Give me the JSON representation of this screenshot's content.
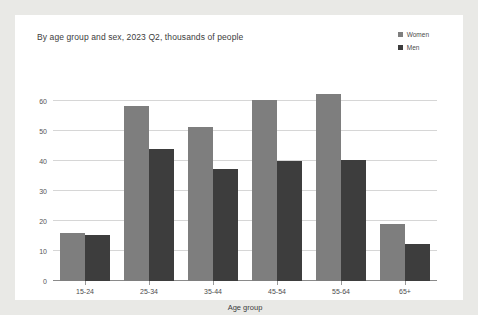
{
  "chart_data": {
    "type": "bar",
    "title": "By age group and sex, 2023 Q2, thousands of people",
    "xlabel": "Age group",
    "ylabel": "",
    "categories": [
      "15-24",
      "25-34",
      "35-44",
      "45-54",
      "55-64",
      "65+"
    ],
    "series": [
      {
        "name": "Women",
        "color": "#7e7e7e",
        "values": [
          16,
          58.5,
          51.5,
          60.5,
          62.5,
          19
        ]
      },
      {
        "name": "Men",
        "color": "#3d3d3d",
        "values": [
          15.5,
          44,
          37.5,
          40,
          40.5,
          12.5
        ]
      }
    ],
    "ylim": [
      0,
      65
    ],
    "yticks": [
      0,
      10,
      20,
      30,
      40,
      50,
      60
    ],
    "grid": true,
    "legend_position": "top-right"
  },
  "legend": {
    "items": [
      {
        "label": "Women",
        "color": "#7e7e7e"
      },
      {
        "label": "Men",
        "color": "#3d3d3d"
      }
    ]
  },
  "colors": {
    "page_background": "#e9e9e6",
    "card_background": "#ffffff",
    "gridline": "#d6d6d6",
    "axis": "#8a8a8a",
    "text": "#3c3c3c"
  }
}
